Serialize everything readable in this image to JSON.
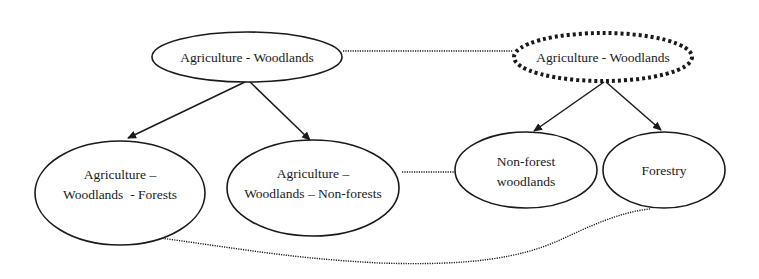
{
  "diagram": {
    "colors": {
      "stroke": "#1a1a1a",
      "background": "#ffffff"
    },
    "nodes": [
      {
        "id": "n1",
        "lines": [
          "Agriculture - Woodlands"
        ],
        "style": "solid"
      },
      {
        "id": "n2",
        "lines": [
          "Agriculture - Woodlands"
        ],
        "style": "dotted-bold"
      },
      {
        "id": "n3",
        "lines": [
          "Agriculture –",
          "Woodlands  - Forests"
        ],
        "style": "solid"
      },
      {
        "id": "n4",
        "lines": [
          "Agriculture –",
          "Woodlands – Non-forests"
        ],
        "style": "solid"
      },
      {
        "id": "n5",
        "lines": [
          "Non-forest",
          "woodlands"
        ],
        "style": "solid"
      },
      {
        "id": "n6",
        "lines": [
          "Forestry"
        ],
        "style": "solid"
      }
    ],
    "edges": [
      {
        "from": "n1",
        "to": "n3",
        "type": "arrow"
      },
      {
        "from": "n1",
        "to": "n4",
        "type": "arrow"
      },
      {
        "from": "n2",
        "to": "n5",
        "type": "arrow"
      },
      {
        "from": "n2",
        "to": "n6",
        "type": "arrow"
      },
      {
        "from": "n1",
        "to": "n2",
        "type": "dotted-link"
      },
      {
        "from": "n4",
        "to": "n5",
        "type": "dotted-link"
      },
      {
        "from": "n3",
        "to": "n6",
        "type": "dotted-curve"
      }
    ]
  }
}
